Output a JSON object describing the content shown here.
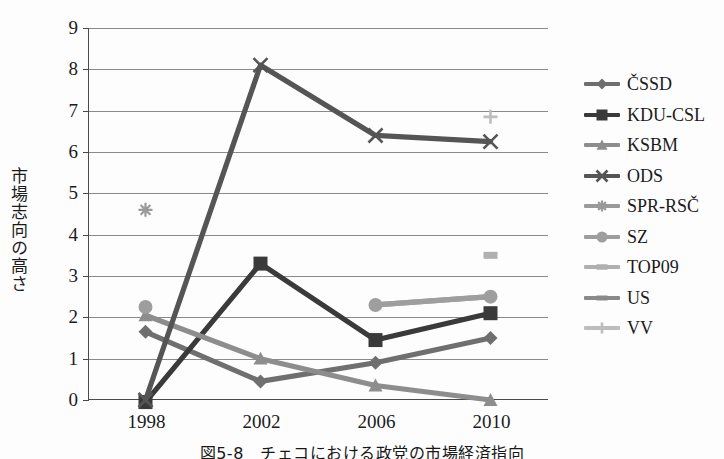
{
  "figure": {
    "caption": "図5-8　チェコにおける政党の市場経済指向",
    "y_axis_title": "市場志向の高さ"
  },
  "chart_data": {
    "type": "line",
    "title": "図5-8　チェコにおける政党の市場経済指向",
    "xlabel": "",
    "ylabel": "市場志向の高さ",
    "categories": [
      "1998",
      "2002",
      "2006",
      "2010"
    ],
    "ylim": [
      0,
      9
    ],
    "yticks": [
      "0",
      "1",
      "2",
      "3",
      "4",
      "5",
      "6",
      "7",
      "8",
      "9"
    ],
    "grid": true,
    "legend_position": "right",
    "series": [
      {
        "name": "ČSSD",
        "color": "#6f6f6f",
        "marker": "diamond",
        "values": [
          1.65,
          0.45,
          0.9,
          1.5
        ]
      },
      {
        "name": "KDU-CSL",
        "color": "#3a3a3a",
        "marker": "square",
        "values": [
          -0.05,
          3.3,
          1.45,
          2.1
        ]
      },
      {
        "name": "KSBM",
        "color": "#8d8d8d",
        "marker": "triangle",
        "values": [
          2.05,
          1.0,
          0.35,
          0.0
        ]
      },
      {
        "name": "ODS",
        "color": "#555555",
        "marker": "cross",
        "values": [
          0.0,
          8.1,
          6.4,
          6.25
        ]
      },
      {
        "name": "SPR-RSČ",
        "color": "#9a9a9a",
        "marker": "star",
        "values": [
          4.6,
          null,
          null,
          null
        ]
      },
      {
        "name": "SZ",
        "color": "#9e9e9e",
        "marker": "circle",
        "values": [
          2.25,
          null,
          2.3,
          2.5
        ]
      },
      {
        "name": "TOP09",
        "color": "#b0b0b0",
        "marker": "dash",
        "values": [
          null,
          null,
          null,
          3.5
        ]
      },
      {
        "name": "US",
        "color": "#898989",
        "marker": "line",
        "values": [
          null,
          null,
          null,
          null
        ]
      },
      {
        "name": "VV",
        "color": "#bdbdbd",
        "marker": "plus",
        "values": [
          null,
          null,
          null,
          6.85
        ]
      }
    ]
  }
}
